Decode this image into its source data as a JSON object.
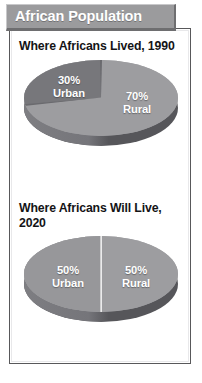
{
  "banner": {
    "title": "African Population",
    "background_color": "#9b9b9d",
    "text_color": "#ffffff"
  },
  "chart_data": [
    {
      "type": "pie",
      "title": "Where Africans Lived, 1990",
      "categories": [
        "Urban",
        "Rural"
      ],
      "values": [
        30,
        70
      ],
      "value_labels": [
        "30%",
        "70%"
      ],
      "category_labels": [
        "Urban",
        "Rural"
      ],
      "slice_colors": [
        "#77777b",
        "#9d9da0"
      ],
      "label_color": "#ffffff",
      "legend": "none",
      "three_d": true
    },
    {
      "type": "pie",
      "title": "Where Africans Will Live, 2020",
      "categories": [
        "Urban",
        "Rural"
      ],
      "values": [
        50,
        50
      ],
      "value_labels": [
        "50%",
        "50%"
      ],
      "category_labels": [
        "Urban",
        "Rural"
      ],
      "slice_colors": [
        "#97979a",
        "#9d9da0"
      ],
      "label_color": "#ffffff",
      "legend": "none",
      "three_d": true
    }
  ]
}
